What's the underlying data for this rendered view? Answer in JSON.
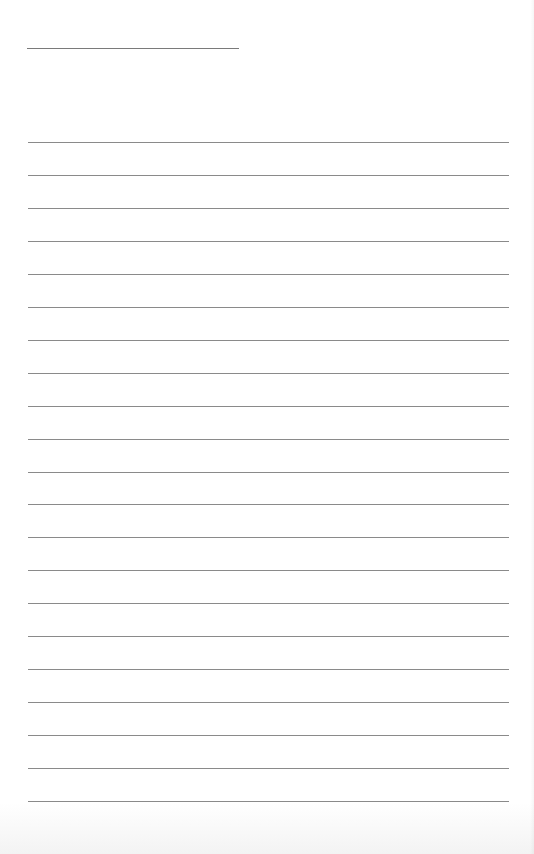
{
  "page": {
    "type": "lined-paper",
    "title_text": "",
    "line_count": 21,
    "line_color": "#8a8a8a",
    "background_color": "#ffffff"
  }
}
